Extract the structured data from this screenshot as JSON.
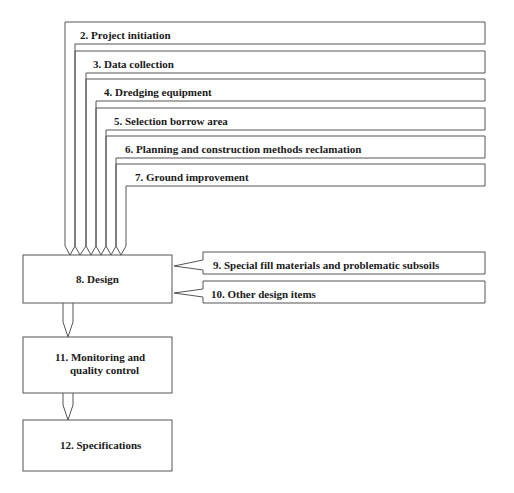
{
  "diagram": {
    "type": "flowchart",
    "stroke_color": "#555555",
    "text_color": "#1a1a1a",
    "input_steps": [
      {
        "id": 2,
        "label": "2. Project initiation"
      },
      {
        "id": 3,
        "label": "3. Data collection"
      },
      {
        "id": 4,
        "label": "4. Dredging equipment"
      },
      {
        "id": 5,
        "label": "5. Selection borrow area"
      },
      {
        "id": 6,
        "label": "6. Planning and construction methods reclamation"
      },
      {
        "id": 7,
        "label": "7. Ground improvement"
      }
    ],
    "design": {
      "id": 8,
      "label": "8. Design"
    },
    "side_inputs": [
      {
        "id": 9,
        "label": "9. Special fill materials and problematic subsoils"
      },
      {
        "id": 10,
        "label": "10. Other design items"
      }
    ],
    "monitoring": {
      "id": 11,
      "line1": "11. Monitoring and",
      "line2": "quality control"
    },
    "specifications": {
      "id": 12,
      "label": "12. Specifications"
    },
    "edges": [
      {
        "from": 2,
        "to": 8
      },
      {
        "from": 3,
        "to": 8
      },
      {
        "from": 4,
        "to": 8
      },
      {
        "from": 5,
        "to": 8
      },
      {
        "from": 6,
        "to": 8
      },
      {
        "from": 7,
        "to": 8
      },
      {
        "from": 9,
        "to": 8
      },
      {
        "from": 10,
        "to": 8
      },
      {
        "from": 8,
        "to": 11
      },
      {
        "from": 11,
        "to": 12
      }
    ]
  }
}
